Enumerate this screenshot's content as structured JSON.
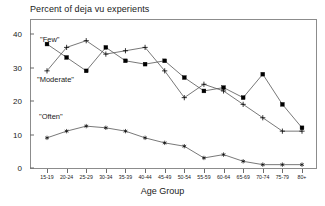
{
  "chart_data": {
    "type": "line",
    "title": "Percent of deja vu experients",
    "xlabel": "Age Group",
    "ylabel": "",
    "ylim": [
      0,
      44
    ],
    "yticks": [
      0,
      10,
      20,
      30,
      40
    ],
    "grid": false,
    "legend_position": "inline-annotations",
    "categories": [
      "15-19",
      "20-24",
      "25-29",
      "30-34",
      "35-39",
      "40-44",
      "45-49",
      "50-54",
      "55-59",
      "60-64",
      "65-69",
      "70-74",
      "75-79",
      "80+"
    ],
    "series": [
      {
        "name": "\"Few\"",
        "marker": "filled-square",
        "values": [
          37,
          33,
          29,
          36,
          32,
          31,
          32,
          27,
          23,
          24,
          21,
          28,
          19,
          12
        ]
      },
      {
        "name": "\"Moderate\"",
        "marker": "plus",
        "values": [
          29,
          36,
          38,
          34,
          35,
          36,
          29,
          21,
          25,
          23,
          19,
          15,
          11,
          11
        ]
      },
      {
        "name": "\"Often\"",
        "marker": "asterisk",
        "values": [
          9,
          11,
          12.5,
          12,
          11,
          9,
          7.5,
          6.5,
          3,
          4,
          2,
          1,
          1,
          1
        ]
      }
    ],
    "annotations": [
      {
        "text": "\"Few\"",
        "series": "Few"
      },
      {
        "text": "\"Moderate\"",
        "series": "Moderate"
      },
      {
        "text": "\"Often\"",
        "series": "Often"
      }
    ],
    "colors": {
      "line": "#555555",
      "marker": "#000000",
      "axis": "#8c8c8c",
      "text": "#1a1a1a"
    }
  }
}
